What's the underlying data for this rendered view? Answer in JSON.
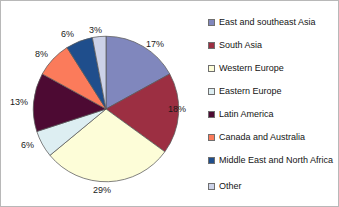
{
  "chart_data": {
    "type": "pie",
    "title": "",
    "subtitle": "",
    "xlabel": "",
    "ylabel": "",
    "legend_position": "right",
    "grid": false,
    "units": "percent",
    "total": 100,
    "categories": [
      "East and southeast Asia",
      "South Asia",
      "Western Europe",
      "Eastern Europe",
      "Latin America",
      "Canada and Australia",
      "Middle East and North Africa",
      "Other"
    ],
    "values": [
      17,
      18,
      29,
      6,
      13,
      8,
      6,
      3
    ],
    "data_labels": [
      "17%",
      "18%",
      "29%",
      "6%",
      "13%",
      "8%",
      "6%",
      "3%"
    ],
    "colors": [
      "#8087bd",
      "#9c2f42",
      "#fdfdd8",
      "#ddeef2",
      "#4d0a33",
      "#fb7b5b",
      "#1f4e8c",
      "#ccd2e8"
    ],
    "slice_border_color": "#5a5a5a",
    "start_angle_deg": 0,
    "direction": "clockwise"
  },
  "legend": {
    "items": [
      {
        "label": "East and southeast Asia",
        "color": "#8087bd"
      },
      {
        "label": "South Asia",
        "color": "#9c2f42"
      },
      {
        "label": "Western Europe",
        "color": "#fdfdd8"
      },
      {
        "label": "Eastern Europe",
        "color": "#ddeef2"
      },
      {
        "label": "Latin America",
        "color": "#4d0a33"
      },
      {
        "label": "Canada and Australia",
        "color": "#fb7b5b"
      },
      {
        "label": "Middle East and North Africa",
        "color": "#1f4e8c"
      },
      {
        "label": "Other",
        "color": "#ccd2e8"
      }
    ]
  },
  "pct_labels": [
    {
      "text": "17%",
      "left": 145,
      "top": 38
    },
    {
      "text": "18%",
      "left": 167,
      "top": 103
    },
    {
      "text": "29%",
      "left": 92,
      "top": 184
    },
    {
      "text": "6%",
      "left": 20,
      "top": 139
    },
    {
      "text": "13%",
      "left": 9,
      "top": 96
    },
    {
      "text": "8%",
      "left": 34,
      "top": 48
    },
    {
      "text": "6%",
      "left": 60,
      "top": 28
    },
    {
      "text": "3%",
      "left": 88,
      "top": 24
    }
  ]
}
